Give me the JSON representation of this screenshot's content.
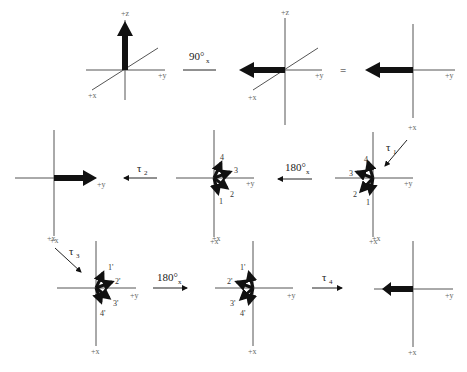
{
  "diagram": {
    "axis_labels": {
      "x": "+x",
      "y": "+y",
      "z": "+z"
    },
    "operators": {
      "rot90x": "90°",
      "rot90x_sub": "x",
      "equals": "=",
      "tau1": "τ",
      "tau1_sub": "1",
      "tau2": "τ",
      "tau2_sub": "2",
      "rot180x_a": "180°",
      "rot180x_a_sub": "x",
      "tau3": "τ",
      "tau3_sub": "3",
      "rot180x_b": "180°",
      "rot180x_b_sub": "x",
      "tau4": "τ",
      "tau4_sub": "4"
    },
    "isochromats_row2": [
      "1",
      "2",
      "3",
      "4"
    ],
    "isochromats_row3": [
      "1'",
      "2'",
      "3'",
      "4'"
    ],
    "panels": [
      {
        "id": 1,
        "row": 1,
        "view": "3D",
        "vector": "+z"
      },
      {
        "id": 2,
        "row": 1,
        "view": "3D",
        "vector": "-y"
      },
      {
        "id": 3,
        "row": 1,
        "view": "top",
        "vector": "-y"
      },
      {
        "id": 4,
        "row": 2,
        "view": "top",
        "vector": "fan 1-4 toward -y"
      },
      {
        "id": 5,
        "row": 2,
        "view": "top",
        "vector": "fan 1-4 toward +y"
      },
      {
        "id": 6,
        "row": 2,
        "view": "top",
        "vector": "+y"
      },
      {
        "id": 7,
        "row": 3,
        "view": "top",
        "vector": "fan 1'-4' toward +y"
      },
      {
        "id": 8,
        "row": 3,
        "view": "top",
        "vector": "fan 1'-4' toward -y"
      },
      {
        "id": 9,
        "row": 3,
        "view": "top",
        "vector": "-y"
      }
    ]
  }
}
